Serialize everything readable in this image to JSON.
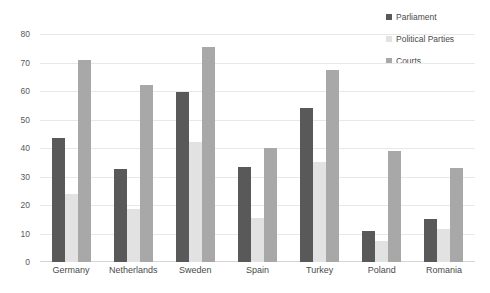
{
  "chart_data": {
    "type": "bar",
    "title": "",
    "xlabel": "",
    "ylabel": "",
    "ylim": [
      0,
      80
    ],
    "yticks": [
      0,
      10,
      20,
      30,
      40,
      50,
      60,
      70,
      80
    ],
    "grid": true,
    "legend_position": "top-right",
    "categories": [
      "Germany",
      "Netherlands",
      "Sweden",
      "Spain",
      "Turkey",
      "Poland",
      "Romania"
    ],
    "series": [
      {
        "name": "Parliament",
        "color": "#595959",
        "values": [
          43.5,
          32.5,
          59.5,
          33.5,
          54,
          11,
          15
        ]
      },
      {
        "name": "Political Parties",
        "color": "#e2e2e2",
        "values": [
          24,
          18.5,
          42,
          15.5,
          35,
          7.5,
          11.5
        ]
      },
      {
        "name": "Courts",
        "color": "#a8a8a8",
        "values": [
          71,
          62,
          75.5,
          40,
          67.5,
          39,
          33
        ]
      }
    ]
  },
  "axis": {
    "tick_labels": [
      "0",
      "10",
      "20",
      "30",
      "40",
      "50",
      "60",
      "70",
      "80"
    ]
  },
  "legend": {
    "items": [
      {
        "label": "Parliament",
        "color": "#595959"
      },
      {
        "label": "Political Parties",
        "color": "#e2e2e2"
      },
      {
        "label": "Courts",
        "color": "#a8a8a8"
      }
    ]
  }
}
